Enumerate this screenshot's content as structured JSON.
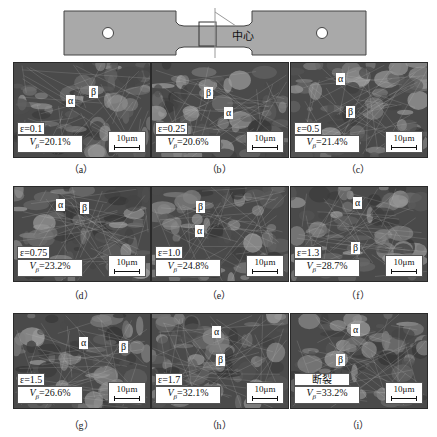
{
  "specimen": {
    "center_label": "中心",
    "body_color": "#a9a9a9",
    "outline_color": "#444444"
  },
  "scale_bar": "10μm",
  "panels": [
    {
      "id": "a",
      "caption": "（a）",
      "strain": "ε=0.1",
      "vb": "V",
      "vb_sub": "β",
      "vb_val": "=20.1%",
      "alpha": "α",
      "beta": "β"
    },
    {
      "id": "b",
      "caption": "（b）",
      "strain": "ε=0.25",
      "vb": "V",
      "vb_sub": "β",
      "vb_val": "=20.6%",
      "alpha": "α",
      "beta": "β"
    },
    {
      "id": "c",
      "caption": "（c）",
      "strain": "ε=0.5",
      "vb": "V",
      "vb_sub": "β",
      "vb_val": "=21.4%",
      "alpha": "α",
      "beta": "β"
    },
    {
      "id": "d",
      "caption": "（d）",
      "strain": "ε=0.75",
      "vb": "V",
      "vb_sub": "β",
      "vb_val": "=23.2%",
      "alpha": "α",
      "beta": "β"
    },
    {
      "id": "e",
      "caption": "（e）",
      "strain": "ε=1.0",
      "vb": "V",
      "vb_sub": "β",
      "vb_val": "=24.8%",
      "alpha": "α",
      "beta": "β"
    },
    {
      "id": "f",
      "caption": "（f）",
      "strain": "ε=1.3",
      "vb": "V",
      "vb_sub": "β",
      "vb_val": "=28.7%",
      "alpha": "α",
      "beta": "β"
    },
    {
      "id": "g",
      "caption": "（g）",
      "strain": "ε=1.5",
      "vb": "V",
      "vb_sub": "β",
      "vb_val": "=26.6%",
      "alpha": "α",
      "beta": "β"
    },
    {
      "id": "h",
      "caption": "（h）",
      "strain": "ε=1.7",
      "vb": "V",
      "vb_sub": "β",
      "vb_val": "=32.1%",
      "alpha": "α",
      "beta": "β"
    },
    {
      "id": "i",
      "caption": "（i）",
      "strain": "断裂",
      "vb": "V",
      "vb_sub": "β",
      "vb_val": "=33.2%",
      "alpha": "α",
      "beta": "β"
    }
  ]
}
